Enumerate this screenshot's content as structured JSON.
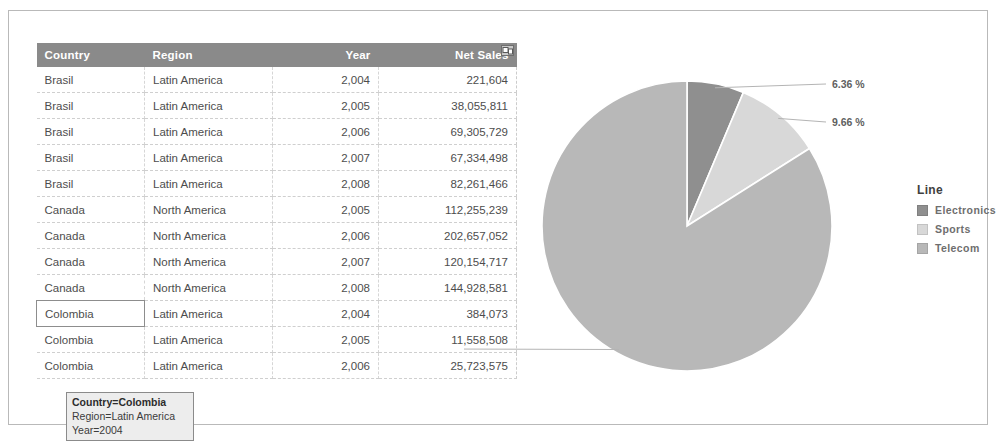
{
  "table": {
    "columns": [
      {
        "key": "country",
        "label": "Country",
        "align": "left"
      },
      {
        "key": "region",
        "label": "Region",
        "align": "left"
      },
      {
        "key": "year",
        "label": "Year",
        "align": "right"
      },
      {
        "key": "net_sales",
        "label": "Net Sales",
        "align": "right"
      }
    ],
    "header_icon": "restore-window-icon",
    "rows": [
      {
        "country": "Brasil",
        "region": "Latin America",
        "year": "2,004",
        "net_sales": "221,604"
      },
      {
        "country": "Brasil",
        "region": "Latin America",
        "year": "2,005",
        "net_sales": "38,055,811"
      },
      {
        "country": "Brasil",
        "region": "Latin America",
        "year": "2,006",
        "net_sales": "69,305,729"
      },
      {
        "country": "Brasil",
        "region": "Latin America",
        "year": "2,007",
        "net_sales": "67,334,498"
      },
      {
        "country": "Brasil",
        "region": "Latin America",
        "year": "2,008",
        "net_sales": "82,261,466"
      },
      {
        "country": "Canada",
        "region": "North America",
        "year": "2,005",
        "net_sales": "112,255,239"
      },
      {
        "country": "Canada",
        "region": "North America",
        "year": "2,006",
        "net_sales": "202,657,052"
      },
      {
        "country": "Canada",
        "region": "North America",
        "year": "2,007",
        "net_sales": "120,154,717"
      },
      {
        "country": "Canada",
        "region": "North America",
        "year": "2,008",
        "net_sales": "144,928,581"
      },
      {
        "country": "Colombia",
        "region": "Latin America",
        "year": "2,004",
        "net_sales": "384,073",
        "selected": true
      },
      {
        "country": "Colombia",
        "region": "Latin America",
        "year": "2,005",
        "net_sales": "11,558,508"
      },
      {
        "country": "Colombia",
        "region": "Latin America",
        "year": "2,006",
        "net_sales": "25,723,575"
      }
    ]
  },
  "tooltip": {
    "line1": "Country=Colombia",
    "line2": "Region=Latin America",
    "line3": "Year=2004"
  },
  "legend": {
    "title": "Line",
    "items": [
      {
        "label": "Electronics",
        "color": "#8f8f8f"
      },
      {
        "label": "Sports",
        "color": "#d8d8d8"
      },
      {
        "label": "Telecom",
        "color": "#b8b8b8"
      }
    ]
  },
  "chart_data": {
    "type": "pie",
    "title": "",
    "legend_title": "Line",
    "legend_position": "right",
    "labels": [
      "Electronics",
      "Sports",
      "Telecom"
    ],
    "values": [
      6.36,
      9.66,
      83.99
    ],
    "value_unit": "%",
    "data_labels": [
      "6.36 %",
      "9.66 %",
      "83.99 %"
    ],
    "colors": [
      "#8f8f8f",
      "#d8d8d8",
      "#b8b8b8"
    ],
    "start_angle_deg": 0,
    "direction": "clockwise",
    "leader_lines": true,
    "grid": false
  }
}
